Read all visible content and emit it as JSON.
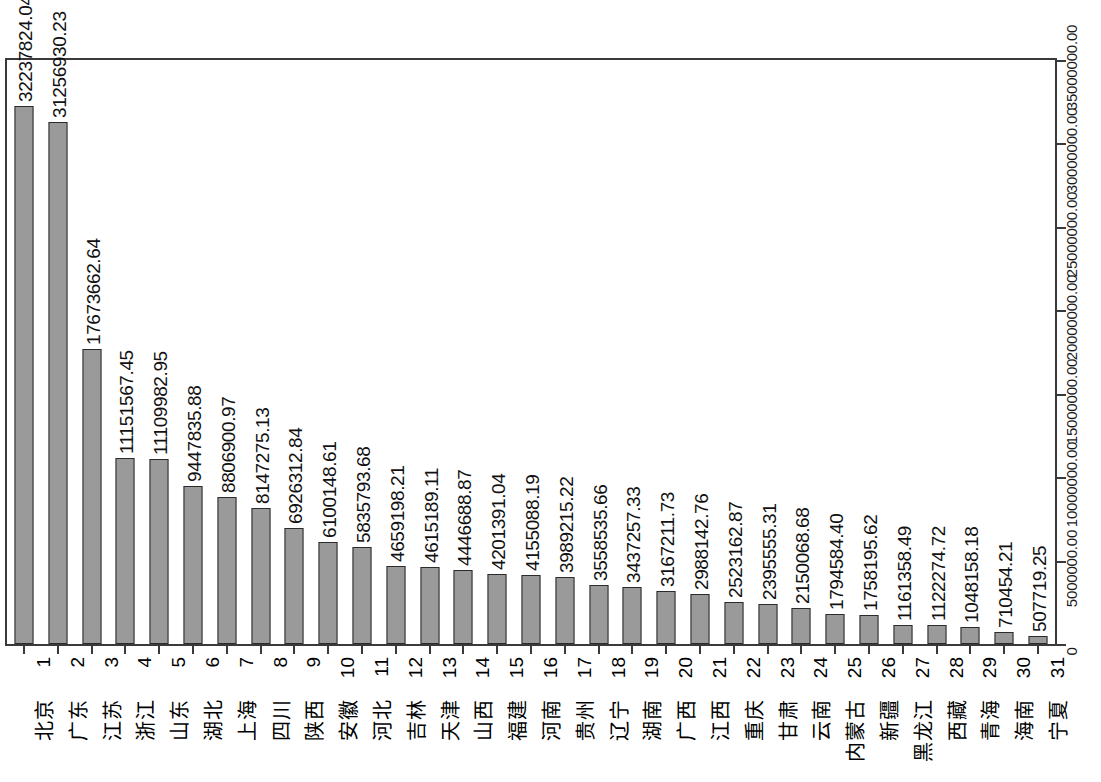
{
  "chart_data": {
    "type": "bar",
    "title": "",
    "subtitle": "",
    "xlabel": "",
    "ylabel": "",
    "orientation": "vertical",
    "grid": false,
    "legend": null,
    "y_axis_position": "right",
    "label_rotation": "-90",
    "ylim": [
      0,
      35000000.0
    ],
    "ytick_labels": [
      "0",
      "5000000.00",
      "10000000.00",
      "15000000.00",
      "20000000.00",
      "25000000.00",
      "30000000.00",
      "35000000.00"
    ],
    "ytick_values": [
      0,
      5000000,
      10000000,
      15000000,
      20000000,
      25000000,
      30000000,
      35000000
    ],
    "rank_labels": [
      "1",
      "2",
      "3",
      "4",
      "5",
      "6",
      "7",
      "8",
      "9",
      "10",
      "11",
      "12",
      "13",
      "14",
      "15",
      "16",
      "17",
      "18",
      "19",
      "20",
      "21",
      "22",
      "23",
      "24",
      "25",
      "26",
      "27",
      "28",
      "29",
      "30",
      "31"
    ],
    "categories": [
      "北京",
      "广东",
      "江苏",
      "浙江",
      "山东",
      "湖北",
      "上海",
      "四川",
      "陕西",
      "安徽",
      "河北",
      "吉林",
      "天津",
      "山西",
      "福建",
      "河南",
      "贵州",
      "辽宁",
      "湖南",
      "广西",
      "江西",
      "重庆",
      "甘肃",
      "云南",
      "内蒙古",
      "新疆",
      "黑龙江",
      "西藏",
      "青海",
      "海南",
      "宁夏"
    ],
    "values": [
      32237824.04,
      31256930.23,
      17673662.64,
      11151567.45,
      11109982.95,
      9447835.88,
      8806900.97,
      8147275.13,
      6926312.84,
      6100148.61,
      5835793.68,
      4659198.21,
      4615189.11,
      4446688.87,
      4201391.04,
      4155088.19,
      3989215.22,
      3558535.66,
      3437257.33,
      3167211.73,
      2988142.76,
      2523162.87,
      2395555.31,
      2150068.68,
      1794584.4,
      1758195.62,
      1161358.49,
      1122274.72,
      1048158.18,
      710454.21,
      507719.25
    ],
    "value_labels": [
      "32237824.04",
      "31256930.23",
      "17673662.64",
      "11151567.45",
      "11109982.95",
      "9447835.88",
      "8806900.97",
      "8147275.13",
      "6926312.84",
      "6100148.61",
      "5835793.68",
      "4659198.21",
      "4615189.11",
      "4446688.87",
      "4201391.04",
      "4155088.19",
      "3989215.22",
      "3558535.66",
      "3437257.33",
      "3167211.73",
      "2988142.76",
      "2523162.87",
      "2395555.31",
      "2150068.68",
      "1794584.40",
      "1758195.62",
      "1161358.49",
      "1122274.72",
      "1048158.18",
      "710454.21",
      "507719.25"
    ],
    "colors": {
      "bar_fill": "#9a9a9a",
      "bar_border": "#2b2b2b",
      "axis": "#3a3a3a",
      "text": "#111111",
      "background": "#ffffff"
    }
  }
}
